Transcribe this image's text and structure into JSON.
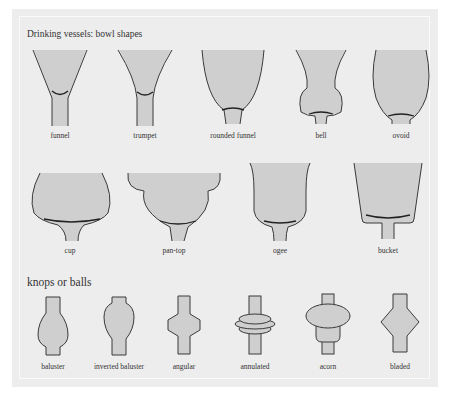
{
  "figure": {
    "title": "Drinking vessels: bowl shapes",
    "bowls": [
      {
        "id": "funnel",
        "label": "funnel"
      },
      {
        "id": "trumpet",
        "label": "trumpet"
      },
      {
        "id": "rounded-funnel",
        "label": "rounded funnel"
      },
      {
        "id": "bell",
        "label": "bell"
      },
      {
        "id": "ovoid",
        "label": "ovoid"
      },
      {
        "id": "cup",
        "label": "cup"
      },
      {
        "id": "pan-top",
        "label": "pan-top"
      },
      {
        "id": "ogee",
        "label": "ogee"
      },
      {
        "id": "bucket",
        "label": "bucket"
      }
    ],
    "knops_title": "knops or balls",
    "knops": [
      {
        "id": "baluster",
        "label": "baluster"
      },
      {
        "id": "inverted-baluster",
        "label": "inverted baluster"
      },
      {
        "id": "angular",
        "label": "angular"
      },
      {
        "id": "annulated",
        "label": "annulated"
      },
      {
        "id": "acorn",
        "label": "acorn"
      },
      {
        "id": "bladed",
        "label": "bladed"
      }
    ],
    "colors": {
      "panel": "#ededed",
      "fill": "#cfcfcf",
      "stroke": "#3a3a3a"
    }
  }
}
